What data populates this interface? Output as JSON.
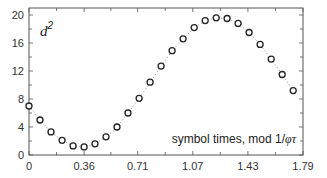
{
  "chart_data": {
    "type": "scatter",
    "title": "",
    "xlabel": "",
    "ylabel": "d²",
    "ylabel_base": "d",
    "ylabel_sup": "2",
    "annotation": "symbol times, mod 1/φτ",
    "annotation_plain": "symbol times, mod 1/",
    "annotation_italic": "φτ",
    "xlim": [
      0,
      1.79
    ],
    "ylim": [
      0,
      21
    ],
    "xticks": [
      0,
      0.36,
      0.71,
      1.07,
      1.43,
      1.79
    ],
    "xtick_labels": [
      "0",
      "0.36",
      "0.71",
      "1.07",
      "1.43",
      "1.79"
    ],
    "yticks": [
      0,
      4,
      8,
      12,
      16,
      20
    ],
    "ytick_labels": [
      "0",
      "4",
      "8",
      "12",
      "16",
      "20"
    ],
    "grid": false,
    "legend": null,
    "marker": "open-circle",
    "line_style": "dotted",
    "series": [
      {
        "name": "d²",
        "x": [
          0,
          0.072,
          0.144,
          0.216,
          0.288,
          0.36,
          0.431,
          0.503,
          0.575,
          0.647,
          0.719,
          0.791,
          0.863,
          0.935,
          1.007,
          1.079,
          1.151,
          1.223,
          1.294,
          1.366,
          1.438,
          1.51,
          1.582,
          1.654,
          1.726
        ],
        "values": [
          7.0,
          5.0,
          3.3,
          2.1,
          1.3,
          1.15,
          1.6,
          2.6,
          4.0,
          6.0,
          8.1,
          10.4,
          12.7,
          14.9,
          16.6,
          18.2,
          19.2,
          19.6,
          19.5,
          18.8,
          17.5,
          15.8,
          13.7,
          11.5,
          9.2
        ]
      }
    ]
  },
  "colors": {
    "axis": "#555555",
    "marker": "#222222",
    "line": "#888888",
    "text": "#333333"
  }
}
